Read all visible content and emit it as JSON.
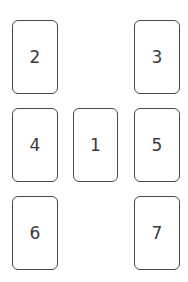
{
  "diagram": {
    "title": "",
    "cards": [
      {
        "label": "2",
        "x": 12,
        "y": 20,
        "w": 46,
        "h": 74
      },
      {
        "label": "3",
        "x": 134,
        "y": 20,
        "w": 46,
        "h": 74
      },
      {
        "label": "4",
        "x": 12,
        "y": 108,
        "w": 46,
        "h": 74
      },
      {
        "label": "1",
        "x": 73,
        "y": 108,
        "w": 45,
        "h": 74
      },
      {
        "label": "5",
        "x": 134,
        "y": 108,
        "w": 46,
        "h": 74
      },
      {
        "label": "6",
        "x": 12,
        "y": 196,
        "w": 46,
        "h": 74
      },
      {
        "label": "7",
        "x": 134,
        "y": 196,
        "w": 46,
        "h": 74
      }
    ],
    "colors": {
      "border": "#4a4a4a",
      "text": "#3a3a3a",
      "background": "#ffffff"
    }
  }
}
